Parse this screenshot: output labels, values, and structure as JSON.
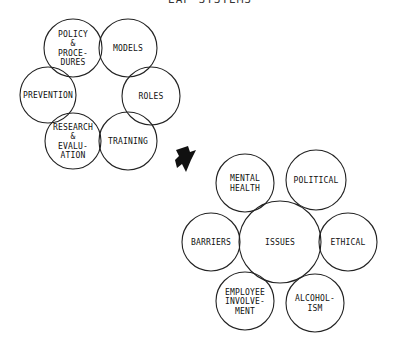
{
  "title": "EAP SYSTEMS",
  "clusters": [
    {
      "name": "eap-system-components",
      "nodes": [
        {
          "id": "policy",
          "lines": [
            "POLICY",
            "&",
            "PROCE-",
            "DURES"
          ],
          "cx": 73,
          "cy": 48,
          "r": 29
        },
        {
          "id": "models",
          "lines": [
            "MODELS"
          ],
          "cx": 128,
          "cy": 48,
          "r": 29
        },
        {
          "id": "roles",
          "lines": [
            "ROLES"
          ],
          "cx": 151,
          "cy": 96,
          "r": 29
        },
        {
          "id": "training",
          "lines": [
            "TRAINING"
          ],
          "cx": 128,
          "cy": 141,
          "r": 29
        },
        {
          "id": "research",
          "lines": [
            "RESEARCH",
            "&",
            "EVALU-",
            "ATION"
          ],
          "cx": 73,
          "cy": 141,
          "r": 28
        },
        {
          "id": "prevention",
          "lines": [
            "PREVENTION"
          ],
          "cx": 48,
          "cy": 95,
          "r": 28
        }
      ]
    },
    {
      "name": "eap-issues",
      "nodes": [
        {
          "id": "issues",
          "lines": [
            "ISSUES"
          ],
          "cx": 280,
          "cy": 242,
          "r": 41
        },
        {
          "id": "mental-health",
          "lines": [
            "MENTAL",
            "HEALTH"
          ],
          "cx": 245,
          "cy": 183,
          "r": 29
        },
        {
          "id": "political",
          "lines": [
            "POLITICAL"
          ],
          "cx": 316,
          "cy": 180,
          "r": 30
        },
        {
          "id": "barriers",
          "lines": [
            "BARRIERS"
          ],
          "cx": 211,
          "cy": 242,
          "r": 29
        },
        {
          "id": "ethical",
          "lines": [
            "ETHICAL"
          ],
          "cx": 348,
          "cy": 242,
          "r": 29
        },
        {
          "id": "employee-involvement",
          "lines": [
            "EMPLOYEE",
            "INVOLVE-",
            "MENT"
          ],
          "cx": 245,
          "cy": 301,
          "r": 29
        },
        {
          "id": "alcoholism",
          "lines": [
            "ALCOHOL-",
            "ISM"
          ],
          "cx": 315,
          "cy": 303,
          "r": 29
        }
      ]
    }
  ],
  "arrow": {
    "direction": "down-right",
    "x": 185,
    "y": 158
  }
}
